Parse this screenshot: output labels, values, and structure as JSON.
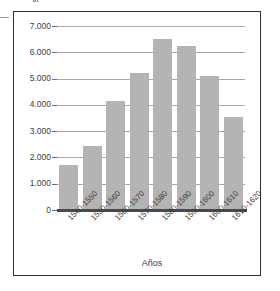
{
  "chart_data": {
    "type": "bar",
    "title": "",
    "xlabel": "Años",
    "ylabel_lines": [
      "Número de causas de fe",
      "sentenciadas por la Inquisición"
    ],
    "ylabel": "Número de causas de fe sentenciadas por la Inquisición",
    "categories": [
      "1540-1550",
      "1550-1560",
      "1560-1570",
      "1570-1580",
      "1580-1590",
      "1590-1600",
      "1600-1610",
      "1610-1620"
    ],
    "values": [
      1700,
      2450,
      4150,
      5200,
      6500,
      6250,
      5100,
      3550
    ],
    "ylim": [
      0,
      7000
    ],
    "ytick_values": [
      0,
      1000,
      2000,
      3000,
      4000,
      5000,
      6000,
      7000
    ],
    "ytick_labels": [
      "0",
      "1.000",
      "2.000",
      "3.000",
      "4.000",
      "5.000",
      "6.000",
      "7.000"
    ],
    "grid": true,
    "legend": null,
    "bar_color": "#b4b4b4",
    "gridline_color": "#a8a8a8",
    "axis_color": "#4a4a4a",
    "frame_color": "#2f2f2f",
    "background_color": "#ffffff"
  }
}
